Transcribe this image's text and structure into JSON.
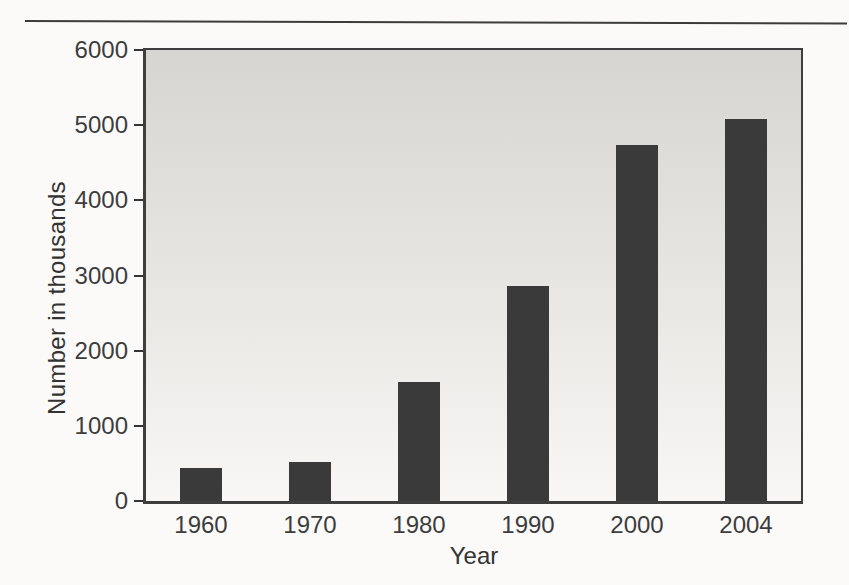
{
  "chart_data": {
    "type": "bar",
    "title": "",
    "categories": [
      "1960",
      "1970",
      "1980",
      "1990",
      "2000",
      "2004"
    ],
    "values": [
      439,
      523,
      1589,
      2856,
      4736,
      5080
    ],
    "xlabel": "Year",
    "ylabel": "Number in thousands",
    "ylim": [
      0,
      6000
    ],
    "yticks": [
      0,
      1000,
      2000,
      3000,
      4000,
      5000,
      6000
    ],
    "grid": false,
    "legend": false,
    "bar_color": "#3b3a3a",
    "bar_width_px": 42,
    "plot_bg_gradient_top": "#d6d5d2",
    "plot_bg_gradient_mid": "#e8e7e4",
    "plot_bg_gradient_bottom": "#f8f7f5",
    "axis_color": "#343434",
    "text_color": "#3d3d3d"
  }
}
